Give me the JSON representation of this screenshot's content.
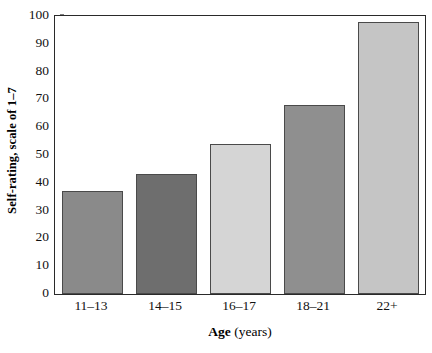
{
  "chart_data": {
    "type": "bar",
    "title": "",
    "subtitle": "",
    "xlabel_bold": "Age",
    "xlabel_plain": "(years)",
    "xlabel": "Age (years)",
    "ylabel": "Self-rating, scale of 1–7",
    "categories": [
      "11–13",
      "14–15",
      "16–17",
      "18–21",
      "22+"
    ],
    "values": [
      37,
      43,
      54,
      68,
      98
    ],
    "bar_colors": [
      "#8a8a8a",
      "#6e6e6e",
      "#d5d5d5",
      "#8f8f8f",
      "#c5c5c5"
    ],
    "bar_edge_color": "#4a4a4a",
    "ylim": [
      0,
      100
    ],
    "yticks": [
      0,
      10,
      20,
      30,
      40,
      50,
      60,
      70,
      80,
      90,
      100
    ],
    "ytick_labels": [
      "0",
      "10",
      "20",
      "30",
      "40",
      "50",
      "60",
      "70",
      "80",
      "90",
      "100"
    ],
    "grid": false,
    "legend": false,
    "legend_position": "none",
    "frame": "box",
    "axis_color": "#2a2a2a",
    "background": "#ffffff"
  }
}
